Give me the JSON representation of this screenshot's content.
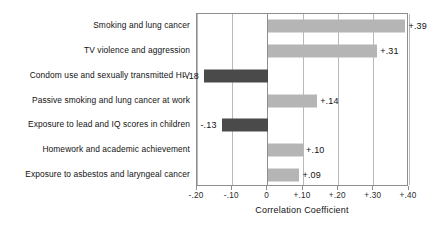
{
  "chart_data": {
    "type": "bar",
    "orientation": "horizontal",
    "title": "",
    "xlabel": "Correlation Coefficient",
    "ylabel": "",
    "xlim": [
      -0.2,
      0.4
    ],
    "grid": true,
    "legend": "none",
    "tick_labels": [
      "-.20",
      "-.10",
      "0",
      "+.10",
      "+.20",
      "+.30",
      "+.40"
    ],
    "tick_values": [
      -0.2,
      -0.1,
      0,
      0.1,
      0.2,
      0.3,
      0.4
    ],
    "categories": [
      "Smoking and lung cancer",
      "TV violence and aggression",
      "Condom use and sexually transmitted HIV",
      "Passive smoking and lung cancer at work",
      "Exposure to lead and IQ scores in children",
      "Homework and academic achievement",
      "Exposure to asbestos and laryngeal cancer"
    ],
    "values": [
      0.39,
      0.31,
      -0.18,
      0.14,
      -0.13,
      0.1,
      0.09
    ],
    "value_labels": [
      "+.39",
      "+.31",
      "-.18",
      "+.14",
      "-.13",
      "+.10",
      "+.09"
    ],
    "colors": {
      "positive_bar": "#b5b5b5",
      "negative_bar": "#4a4a4a",
      "frame": "#8e8e8e",
      "gridline": "#b9b9b9",
      "text": "#121212",
      "background": "#ffffff"
    }
  }
}
